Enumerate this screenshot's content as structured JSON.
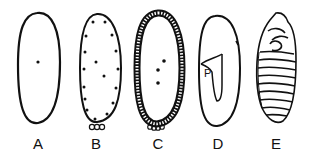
{
  "figure": {
    "panels": [
      {
        "id": "A",
        "label": "A",
        "description": "Fertilized egg with single nucleus"
      },
      {
        "id": "B",
        "label": "B",
        "description": "Nuclei migrating to periphery; pole cells at posterior"
      },
      {
        "id": "C",
        "label": "C",
        "description": "Cellular blastoderm with pole cells"
      },
      {
        "id": "D",
        "label": "D",
        "description": "Germ band formation",
        "annotation": "P"
      },
      {
        "id": "E",
        "label": "E",
        "description": "Segmented embryo"
      }
    ],
    "line_color": "#111111",
    "background": "#ffffff"
  }
}
